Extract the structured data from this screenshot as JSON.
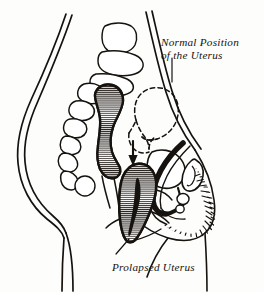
{
  "figure": {
    "type": "medical-illustration",
    "view": "midsagittal",
    "background_color": "#fdfdfc",
    "ink_color": "#16130f",
    "hatch_color": "#2a2520"
  },
  "annotations": {
    "normal_position": {
      "line1": "Normal Position",
      "line2": "of the Uterus",
      "leader": "vertical-line-down"
    },
    "prolapsed": {
      "label": "Prolapsed Uterus",
      "leader": "diagonal-line-up-right"
    }
  },
  "structures": [
    {
      "name": "body-outline",
      "style": "open-contour",
      "fill": "none"
    },
    {
      "name": "spine-sacrum",
      "style": "segmented-vertebrae",
      "fill": "none"
    },
    {
      "name": "rectum",
      "style": "horizontal-hatch",
      "fill": "hatched"
    },
    {
      "name": "uterus-normal-position",
      "style": "dashed-outline",
      "fill": "none"
    },
    {
      "name": "uterus-prolapsed",
      "style": "horizontal-hatch",
      "fill": "hatched"
    },
    {
      "name": "bladder",
      "style": "solid-contour",
      "fill": "none"
    },
    {
      "name": "urethra",
      "style": "heavy-black-stroke",
      "fill": "solid"
    },
    {
      "name": "vaginal-canal",
      "style": "heavy-black-stroke",
      "fill": "solid"
    },
    {
      "name": "pubic-bone",
      "style": "oval-contour",
      "fill": "none"
    },
    {
      "name": "pubic-hair",
      "style": "short-stroke-texture",
      "fill": "none"
    },
    {
      "name": "descent-arrow",
      "style": "solid-arrow-down",
      "fill": "solid"
    }
  ],
  "colors": {
    "ink": "#16130f",
    "hatch": "#2a2520",
    "paper": "#fdfdfc"
  }
}
